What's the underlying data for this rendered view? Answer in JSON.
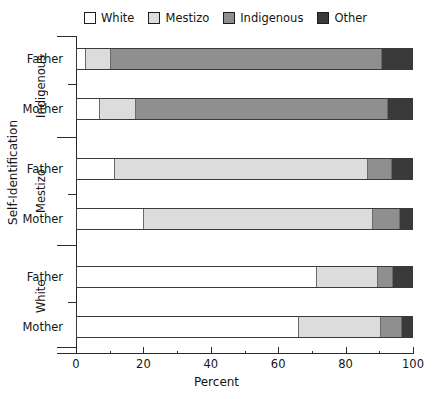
{
  "chart_data": {
    "type": "bar",
    "orientation": "horizontal",
    "stacked": true,
    "stack_normalized": true,
    "title": "",
    "xlabel": "Percent",
    "ylabel": "Self-Identification",
    "xlim": [
      0,
      100
    ],
    "xticks": [
      0,
      20,
      40,
      60,
      80,
      100
    ],
    "xticklabels": [
      "0",
      "20",
      "40",
      "60",
      "80",
      "100"
    ],
    "grid": false,
    "legend_position": "top",
    "legend": [
      "White",
      "Mestizo",
      "Indigenous",
      "Other"
    ],
    "series": [
      {
        "name": "White",
        "color": "#ffffff",
        "values": [
          2.5,
          6.5,
          11.0,
          19.6,
          71.2,
          65.9
        ]
      },
      {
        "name": "Mestizo",
        "color": "#dcdcdc",
        "values": [
          7.3,
          10.7,
          75.6,
          68.5,
          18.4,
          24.6
        ]
      },
      {
        "name": "Indigenous",
        "color": "#8f8f8f",
        "values": [
          81.0,
          75.4,
          7.2,
          8.0,
          4.4,
          6.2
        ]
      },
      {
        "name": "Other",
        "color": "#3a3a3a",
        "values": [
          9.2,
          7.4,
          6.2,
          3.9,
          6.0,
          3.3
        ]
      }
    ],
    "categories": [
      "Indigenous - Father",
      "Indigenous - Mother",
      "Mestizo - Father",
      "Mestizo - Mother",
      "White - Father",
      "White - Mother"
    ],
    "groups": [
      {
        "label": "Indigenous",
        "bars": [
          {
            "label": "Father",
            "segments": [
              2.5,
              7.3,
              81.0,
              9.2
            ]
          },
          {
            "label": "Mother",
            "segments": [
              6.5,
              10.7,
              75.4,
              7.4
            ]
          }
        ]
      },
      {
        "label": "Mestizo",
        "bars": [
          {
            "label": "Father",
            "segments": [
              11.0,
              75.6,
              7.2,
              6.2
            ]
          },
          {
            "label": "Mother",
            "segments": [
              19.6,
              68.5,
              8.0,
              3.9
            ]
          }
        ]
      },
      {
        "label": "White",
        "bars": [
          {
            "label": "Father",
            "segments": [
              71.2,
              18.4,
              4.4,
              6.0
            ]
          },
          {
            "label": "Mother",
            "segments": [
              65.9,
              24.6,
              6.2,
              3.3
            ]
          }
        ]
      }
    ]
  },
  "colors": {
    "white": "#ffffff",
    "mestizo": "#dcdcdc",
    "indigenous": "#8f8f8f",
    "other": "#3a3a3a",
    "axis": "#2b2b2b",
    "text": "#151515"
  },
  "legend": {
    "items": [
      {
        "label": "White",
        "color": "#ffffff",
        "icon": "legend-swatch-white"
      },
      {
        "label": "Mestizo",
        "color": "#dcdcdc",
        "icon": "legend-swatch-mestizo"
      },
      {
        "label": "Indigenous",
        "color": "#8f8f8f",
        "icon": "legend-swatch-indigenous"
      },
      {
        "label": "Other",
        "color": "#3a3a3a",
        "icon": "legend-swatch-other"
      }
    ]
  },
  "axes": {
    "x": {
      "title": "Percent",
      "ticklabels": [
        "0",
        "20",
        "40",
        "60",
        "80",
        "100"
      ]
    },
    "y": {
      "title": "Self-Identification",
      "group_labels": [
        "Indigenous",
        "Mestizo",
        "White"
      ],
      "bar_labels": [
        "Father",
        "Mother",
        "Father",
        "Mother",
        "Father",
        "Mother"
      ]
    }
  }
}
